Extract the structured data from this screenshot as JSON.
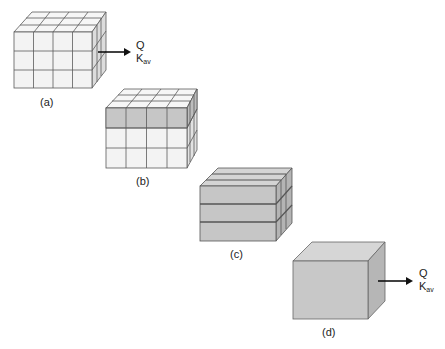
{
  "figure": {
    "panels": [
      {
        "id": "a",
        "label": "(a)",
        "pattern": "all-light",
        "flux": {
          "q": "Q",
          "k": "K",
          "k_sub": "av"
        }
      },
      {
        "id": "b",
        "label": "(b)",
        "pattern": "top-layer-dark"
      },
      {
        "id": "c",
        "label": "(c)",
        "pattern": "three-dark-layers"
      },
      {
        "id": "d",
        "label": "(d)",
        "pattern": "homogeneous",
        "flux": {
          "q": "Q",
          "k": "K",
          "k_sub": "av"
        }
      }
    ]
  },
  "colors": {
    "light_face": "#f4f4f4",
    "light_top": "#f8f8f8",
    "light_side": "#e6e6e6",
    "dark_face": "#c4c4c4",
    "dark_top": "#d6d6d6",
    "dark_side": "#b0b0b0",
    "edge": "#555555",
    "arrow": "#111111"
  }
}
